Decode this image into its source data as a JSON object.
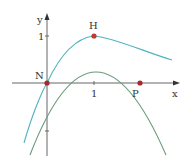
{
  "diagram": {
    "axes": {
      "x_label": "x",
      "y_label": "y",
      "x_tick_label": "1",
      "y_tick_label": "1"
    },
    "points": [
      {
        "name": "N",
        "x": 0,
        "y": 0
      },
      {
        "name": "H",
        "x": 1,
        "y": 1
      },
      {
        "name": "P",
        "x": 2,
        "y": 0
      }
    ],
    "labels": {
      "N": "N",
      "H": "H",
      "P": "P"
    },
    "curves": [
      {
        "name": "parabola",
        "color": "#6a9a7a",
        "passes_through": [
          "N",
          "H",
          "P"
        ]
      },
      {
        "name": "teal-curve",
        "color": "#4fb3bf",
        "passes_through": [
          "N",
          "H"
        ]
      }
    ],
    "colors": {
      "axis": "#555555",
      "point": "#a52a2a",
      "parabola": "#6a9a7a",
      "teal": "#4fb3bf"
    }
  }
}
